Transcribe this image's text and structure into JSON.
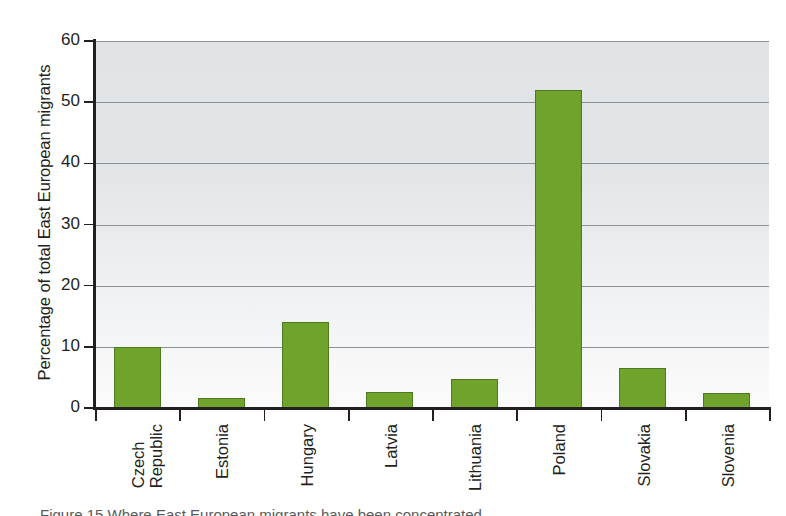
{
  "chart_data": {
    "type": "bar",
    "title": "",
    "xlabel": "",
    "ylabel": "Percentage of total East European migrants",
    "categories": [
      "Czech Republic",
      "Estonia",
      "Hungary",
      "Latvia",
      "Lithuania",
      "Poland",
      "Slovakia",
      "Slovenia"
    ],
    "values": [
      10,
      1.7,
      14,
      2.7,
      4.7,
      52,
      6.5,
      2.5
    ],
    "ylim": [
      0,
      60
    ],
    "ytick_values": [
      0,
      10,
      20,
      30,
      40,
      50,
      60
    ],
    "ytick_labels": [
      "0",
      "10",
      "20",
      "30",
      "40",
      "50",
      "60"
    ],
    "grid": true,
    "legend": "none",
    "bar_color": "#6fa32b",
    "bar_edge_color": "#4d7a1c",
    "plot_background": "#e3e6e8"
  },
  "caption": {
    "text": "Figure 15 Where East European migrants have been concentrated"
  }
}
